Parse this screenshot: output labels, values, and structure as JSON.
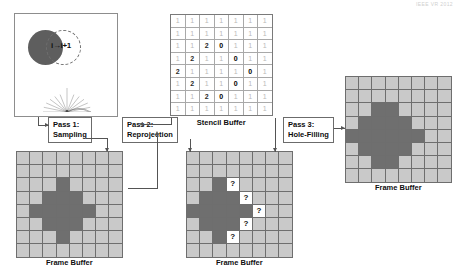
{
  "header_note": "IEEE VR 2012",
  "scene": {
    "frame_label": "i→i+1",
    "solid_circle_color": "#5e5e5e",
    "dashed_circle_color": "#6f6f6f",
    "fan_label": "sampling-fan"
  },
  "passes": [
    {
      "id": "pass1",
      "line1": "Pass 1:",
      "line2": "Sampling"
    },
    {
      "id": "pass2",
      "line1": "Pass 2:",
      "line2": "Reprojection"
    },
    {
      "id": "pass3",
      "line1": "Pass 3:",
      "line2": "Hole-Filling"
    }
  ],
  "stencil": {
    "caption": "Stencil Buffer",
    "cols": 7,
    "rows": 8,
    "values": [
      [
        1,
        1,
        1,
        1,
        1,
        1,
        1
      ],
      [
        1,
        1,
        1,
        1,
        1,
        1,
        1
      ],
      [
        1,
        1,
        2,
        0,
        1,
        1,
        1
      ],
      [
        1,
        2,
        1,
        1,
        0,
        1,
        1
      ],
      [
        2,
        1,
        1,
        1,
        1,
        0,
        1
      ],
      [
        1,
        2,
        1,
        1,
        0,
        1,
        1
      ],
      [
        1,
        1,
        2,
        0,
        1,
        1,
        1
      ],
      [
        1,
        1,
        1,
        1,
        1,
        1,
        1
      ]
    ]
  },
  "frame_buffer_left": {
    "caption": "Frame Buffer",
    "cols": 8,
    "rows": 8,
    "cells": [
      [
        "off",
        "off",
        "off",
        "off",
        "off",
        "off",
        "off",
        "off"
      ],
      [
        "off",
        "off",
        "off",
        "off",
        "off",
        "off",
        "off",
        "off"
      ],
      [
        "off",
        "off",
        "off",
        "on",
        "off",
        "off",
        "off",
        "off"
      ],
      [
        "off",
        "off",
        "on",
        "on",
        "on",
        "off",
        "off",
        "off"
      ],
      [
        "off",
        "on",
        "on",
        "on",
        "on",
        "on",
        "off",
        "off"
      ],
      [
        "off",
        "off",
        "on",
        "on",
        "on",
        "off",
        "off",
        "off"
      ],
      [
        "off",
        "off",
        "off",
        "on",
        "off",
        "off",
        "off",
        "off"
      ],
      [
        "off",
        "off",
        "off",
        "off",
        "off",
        "off",
        "off",
        "off"
      ]
    ]
  },
  "frame_buffer_middle": {
    "caption": "Frame Buffer",
    "cols": 8,
    "rows": 8,
    "cells": [
      [
        "off",
        "off",
        "off",
        "off",
        "off",
        "off",
        "off",
        "off"
      ],
      [
        "off",
        "off",
        "off",
        "off",
        "off",
        "off",
        "off",
        "off"
      ],
      [
        "off",
        "off",
        "on",
        "hole",
        "off",
        "off",
        "off",
        "off"
      ],
      [
        "off",
        "on",
        "on",
        "on",
        "hole",
        "off",
        "off",
        "off"
      ],
      [
        "on",
        "on",
        "on",
        "on",
        "on",
        "hole",
        "off",
        "off"
      ],
      [
        "off",
        "on",
        "on",
        "on",
        "hole",
        "off",
        "off",
        "off"
      ],
      [
        "off",
        "off",
        "on",
        "hole",
        "off",
        "off",
        "off",
        "off"
      ],
      [
        "off",
        "off",
        "off",
        "off",
        "off",
        "off",
        "off",
        "off"
      ]
    ]
  },
  "frame_buffer_right": {
    "caption": "Frame Buffer",
    "cols": 8,
    "rows": 8,
    "cells": [
      [
        "off",
        "off",
        "off",
        "off",
        "off",
        "off",
        "off",
        "off"
      ],
      [
        "off",
        "off",
        "off",
        "off",
        "off",
        "off",
        "off",
        "off"
      ],
      [
        "off",
        "off",
        "on",
        "on",
        "off",
        "off",
        "off",
        "off"
      ],
      [
        "off",
        "on",
        "on",
        "on",
        "on",
        "off",
        "off",
        "off"
      ],
      [
        "on",
        "on",
        "on",
        "on",
        "on",
        "on",
        "off",
        "off"
      ],
      [
        "off",
        "on",
        "on",
        "on",
        "on",
        "off",
        "off",
        "off"
      ],
      [
        "off",
        "off",
        "on",
        "on",
        "off",
        "off",
        "off",
        "off"
      ],
      [
        "off",
        "off",
        "off",
        "off",
        "off",
        "off",
        "off",
        "off"
      ]
    ]
  },
  "colors": {
    "cell_off": "#c9c9c9",
    "cell_on": "#6f6f6f",
    "cell_hole": "#ffffff",
    "grid_line": "#6e6e6e",
    "connector": "#545454",
    "hole_glyph": "?"
  }
}
